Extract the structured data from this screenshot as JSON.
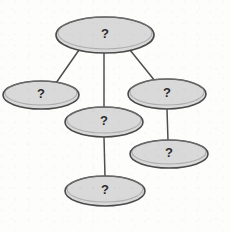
{
  "diagram": {
    "type": "node-link-graph",
    "background_color": "#fdfdfc",
    "node_fill_color": "#d9d9d9",
    "node_stroke_color": "#4a4a4a",
    "edge_color": "#4f4f4f",
    "label_color": "#2b2b2b",
    "nodes": [
      {
        "id": "n1",
        "label": "?",
        "cx": 105,
        "cy": 35,
        "rx": 49,
        "ry": 18,
        "name": "node-top"
      },
      {
        "id": "n2",
        "label": "?",
        "cx": 41,
        "cy": 95,
        "rx": 38,
        "ry": 14,
        "name": "node-left"
      },
      {
        "id": "n3",
        "label": "?",
        "cx": 167,
        "cy": 94,
        "rx": 39,
        "ry": 15,
        "name": "node-right-upper"
      },
      {
        "id": "n4",
        "label": "?",
        "cx": 104,
        "cy": 122,
        "rx": 39,
        "ry": 15,
        "name": "node-middle"
      },
      {
        "id": "n5",
        "label": "?",
        "cx": 169,
        "cy": 154,
        "rx": 39,
        "ry": 14,
        "name": "node-right-lower"
      },
      {
        "id": "n6",
        "label": "?",
        "cx": 105,
        "cy": 191,
        "rx": 40,
        "ry": 15,
        "name": "node-bottom"
      }
    ],
    "edges": [
      {
        "from": "n1",
        "to": "n2",
        "x1": 79,
        "y1": 50,
        "x2": 56,
        "y2": 83,
        "name": "edge-top-to-left"
      },
      {
        "from": "n1",
        "to": "n4",
        "x1": 104,
        "y1": 53,
        "x2": 104,
        "y2": 108,
        "name": "edge-top-to-middle"
      },
      {
        "from": "n1",
        "to": "n3",
        "x1": 130,
        "y1": 50,
        "x2": 155,
        "y2": 81,
        "name": "edge-top-to-right-upper"
      },
      {
        "from": "n3",
        "to": "n5",
        "x1": 167,
        "y1": 109,
        "x2": 168,
        "y2": 141,
        "name": "edge-right-upper-to-right-lower"
      },
      {
        "from": "n4",
        "to": "n6",
        "x1": 104,
        "y1": 137,
        "x2": 105,
        "y2": 177,
        "name": "edge-middle-to-bottom"
      }
    ]
  }
}
